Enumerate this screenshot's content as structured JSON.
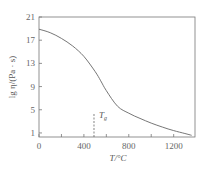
{
  "chart_data": {
    "type": "line",
    "title": "",
    "xlabel": "T/°C",
    "ylabel": "lg η/(Pa · s)",
    "xlim": [
      0,
      1390
    ],
    "ylim": [
      0.3,
      21
    ],
    "x_ticks": [
      0,
      400,
      800,
      1200
    ],
    "y_ticks": [
      1,
      5,
      9,
      13,
      17,
      21
    ],
    "grid": false,
    "series": [
      {
        "name": "viscosity",
        "x": [
          0,
          100,
          200,
          300,
          400,
          500,
          550,
          600,
          700,
          800,
          900,
          1000,
          1100,
          1200,
          1300,
          1360
        ],
        "y": [
          18.9,
          18.3,
          17.3,
          16.0,
          14.2,
          11.6,
          10.0,
          8.3,
          5.6,
          4.4,
          3.5,
          2.7,
          2.0,
          1.4,
          0.9,
          0.6
        ]
      }
    ],
    "annotations": [
      {
        "type": "vline",
        "x": 490,
        "y_from": 0.3,
        "y_to": 4.3,
        "style": "dashed",
        "label": "Tg"
      }
    ]
  },
  "labels": {
    "ylabel_main": "lg η/(Pa · s)",
    "xlabel": "T/°C",
    "tg_T": "T",
    "tg_sub": "g"
  },
  "ticks": {
    "x": [
      "0",
      "400",
      "800",
      "1200"
    ],
    "y": [
      "1",
      "5",
      "9",
      "13",
      "17",
      "21"
    ]
  }
}
